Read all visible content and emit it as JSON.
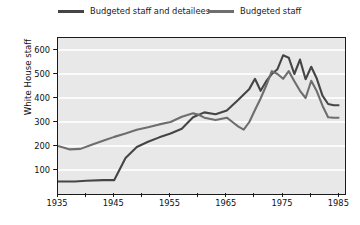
{
  "chart_data": {
    "type": "line",
    "title": "",
    "xlabel": "",
    "ylabel": "White House staff",
    "xlim": [
      1935,
      1986
    ],
    "ylim": [
      0,
      650
    ],
    "grid": true,
    "grid_orientation": "horizontal",
    "legend_position": "top",
    "panel_background": "#e8e8e8",
    "gridline_color": "#fbfbfb",
    "xticks": [
      1935,
      1940,
      1945,
      1950,
      1955,
      1960,
      1965,
      1970,
      1975,
      1980,
      1985
    ],
    "xtick_labels": [
      "1935",
      "",
      "1945",
      "",
      "1955",
      "",
      "1965",
      "",
      "1975",
      "",
      "1985"
    ],
    "yticks": [
      100,
      200,
      300,
      400,
      500,
      600
    ],
    "ytick_labels": [
      "100",
      "200",
      "300",
      "400",
      "500",
      "600"
    ],
    "series": [
      {
        "name": "Budgeted staff and detailees",
        "color": "#454545",
        "linewidth": 2.1,
        "points": [
          [
            1935,
            52
          ],
          [
            1938,
            52
          ],
          [
            1940,
            55
          ],
          [
            1943,
            58
          ],
          [
            1945,
            58
          ],
          [
            1947,
            150
          ],
          [
            1949,
            196
          ],
          [
            1951,
            218
          ],
          [
            1953,
            236
          ],
          [
            1955,
            252
          ],
          [
            1957,
            272
          ],
          [
            1959,
            320
          ],
          [
            1961,
            340
          ],
          [
            1963,
            332
          ],
          [
            1965,
            348
          ],
          [
            1967,
            392
          ],
          [
            1969,
            438
          ],
          [
            1970,
            480
          ],
          [
            1971,
            430
          ],
          [
            1972,
            470
          ],
          [
            1973,
            500
          ],
          [
            1974,
            520
          ],
          [
            1975,
            578
          ],
          [
            1976,
            568
          ],
          [
            1977,
            500
          ],
          [
            1978,
            560
          ],
          [
            1979,
            478
          ],
          [
            1980,
            530
          ],
          [
            1981,
            480
          ],
          [
            1982,
            410
          ],
          [
            1983,
            375
          ],
          [
            1984,
            370
          ],
          [
            1985,
            370
          ]
        ]
      },
      {
        "name": "Budgeted staff",
        "color": "#6e6e6e",
        "linewidth": 2.1,
        "points": [
          [
            1935,
            200
          ],
          [
            1937,
            186
          ],
          [
            1939,
            188
          ],
          [
            1941,
            205
          ],
          [
            1943,
            222
          ],
          [
            1945,
            238
          ],
          [
            1947,
            252
          ],
          [
            1949,
            268
          ],
          [
            1951,
            278
          ],
          [
            1953,
            290
          ],
          [
            1955,
            300
          ],
          [
            1957,
            322
          ],
          [
            1959,
            336
          ],
          [
            1960,
            330
          ],
          [
            1961,
            318
          ],
          [
            1963,
            308
          ],
          [
            1965,
            318
          ],
          [
            1966,
            300
          ],
          [
            1967,
            282
          ],
          [
            1968,
            268
          ],
          [
            1969,
            300
          ],
          [
            1970,
            350
          ],
          [
            1971,
            398
          ],
          [
            1972,
            452
          ],
          [
            1973,
            512
          ],
          [
            1974,
            500
          ],
          [
            1975,
            480
          ],
          [
            1976,
            512
          ],
          [
            1977,
            470
          ],
          [
            1978,
            430
          ],
          [
            1979,
            400
          ],
          [
            1980,
            472
          ],
          [
            1981,
            428
          ],
          [
            1982,
            368
          ],
          [
            1983,
            320
          ],
          [
            1984,
            318
          ],
          [
            1985,
            318
          ]
        ]
      }
    ]
  },
  "legend": {
    "entries": [
      {
        "label": "Budgeted staff and detailees",
        "color": "#454545"
      },
      {
        "label": "Budgeted staff",
        "color": "#6e6e6e"
      }
    ]
  }
}
